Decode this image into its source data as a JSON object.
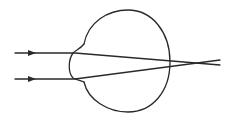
{
  "diagram": {
    "colors": {
      "line": "#2a2a2a",
      "background": "#ffffff"
    },
    "rays": [
      {
        "name": "upper-ray",
        "incoming_y": 53,
        "crosses_behind_retina": true
      },
      {
        "name": "lower-ray",
        "incoming_y": 79,
        "crosses_behind_retina": true
      }
    ],
    "focal_point": "behind-retina"
  }
}
